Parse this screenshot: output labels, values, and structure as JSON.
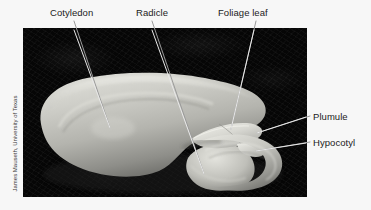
{
  "figure": {
    "background_color": "#f7f7f7",
    "photo": {
      "background_color": "#050505",
      "left": 23,
      "top": 28,
      "width": 284,
      "height": 169
    },
    "credit": "James Mauseth, University of Texas"
  },
  "labels": [
    {
      "id": "cotyledon",
      "text": "Cotyledon",
      "side": "top"
    },
    {
      "id": "radicle",
      "text": "Radicle",
      "side": "top"
    },
    {
      "id": "foliage",
      "text": "Foliage leaf",
      "side": "top"
    },
    {
      "id": "plumule",
      "text": "Plumule",
      "side": "right"
    },
    {
      "id": "hypocotyl",
      "text": "Hypocotyl",
      "side": "right"
    }
  ],
  "leader_lines": [
    {
      "id": "cotyledon-leader",
      "x1": 74,
      "y1": 21,
      "x2": 110,
      "y2": 128
    },
    {
      "id": "radicle-leader",
      "x1": 152,
      "y1": 21,
      "x2": 204,
      "y2": 174
    },
    {
      "id": "foliage-leader",
      "x1": 256,
      "y1": 21,
      "x2": 231,
      "y2": 129
    },
    {
      "id": "plumule-leader",
      "x1": 310,
      "y1": 116,
      "x2": 257,
      "y2": 133
    },
    {
      "id": "hypocotyl-leader",
      "x1": 310,
      "y1": 142,
      "x2": 256,
      "y2": 151
    }
  ],
  "colors": {
    "label_text": "#1b1b1b",
    "leader_line": "#e8e8e8",
    "seed_light": "#cfcfcb",
    "seed_mid": "#a9a9a4",
    "seed_dark": "#6f6f6b",
    "photo_bg": "#050505",
    "page_bg": "#f7f7f7"
  }
}
